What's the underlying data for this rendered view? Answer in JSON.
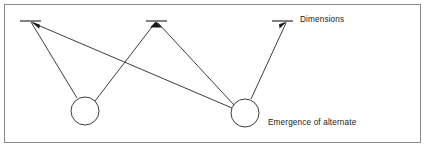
{
  "figure": {
    "type": "concept-diagram",
    "width": 427,
    "height": 150,
    "background_color": "#ffffff",
    "frame_color": "#8a8a8a",
    "stroke_color": "#1a1a1a"
  },
  "labels": {
    "dimensions": "Dimensions",
    "emergence_line_1": "Emergence of alternate",
    "emergence_line_2": "combinations",
    "emergence_line_3": "of dimensional scale values"
  },
  "diagram": {
    "dimension_nodes": [
      {
        "name": "dimension-node-left",
        "x": 30,
        "y": 21,
        "tick_x1": 20,
        "tick_x2": 41
      },
      {
        "name": "dimension-node-middle",
        "x": 156,
        "y": 21,
        "tick_x1": 146,
        "tick_x2": 167
      },
      {
        "name": "dimension-node-right",
        "x": 287,
        "y": 21,
        "tick_x1": 272,
        "tick_x2": 293
      }
    ],
    "combination_nodes": [
      {
        "name": "combination-node-left",
        "cx": 85,
        "cy": 111,
        "r": 14
      },
      {
        "name": "combination-node-right",
        "cx": 245,
        "cy": 113,
        "r": 14
      }
    ],
    "connections": [
      {
        "from": "combination-node-left",
        "to": "dimension-node-left"
      },
      {
        "from": "combination-node-left",
        "to": "dimension-node-middle"
      },
      {
        "from": "combination-node-right",
        "to": "dimension-node-left"
      },
      {
        "from": "combination-node-right",
        "to": "dimension-node-middle"
      },
      {
        "from": "combination-node-right",
        "to": "dimension-node-right"
      }
    ]
  }
}
